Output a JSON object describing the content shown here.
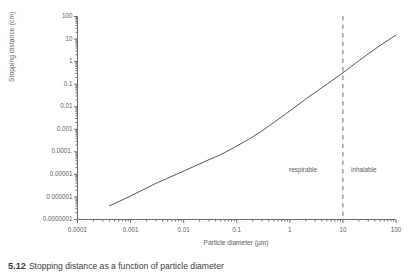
{
  "chart_data": {
    "type": "line",
    "title": "",
    "xlabel": "Particle diameter (µm)",
    "ylabel": "Stopping distance (cm)",
    "xscale": "log",
    "yscale": "log",
    "xlim": [
      0.0001,
      100
    ],
    "ylim": [
      1e-07,
      100
    ],
    "grid": false,
    "legend": "none",
    "x_tick_labels": [
      "0.0001",
      "0.001",
      "0.01",
      "0.1",
      "1",
      "10",
      "100"
    ],
    "x_tick_values": [
      0.0001,
      0.001,
      0.01,
      0.1,
      1,
      10,
      100
    ],
    "y_tick_labels": [
      "100",
      "10",
      "1",
      "0.1",
      "0.01",
      "0.001",
      "0.0001.",
      "0.00001",
      "0.000001",
      "0.0000001"
    ],
    "y_tick_values": [
      100,
      10,
      1,
      0.1,
      0.01,
      0.001,
      0.0001,
      1e-05,
      1e-06,
      1e-07
    ],
    "series": [
      {
        "name": "Stopping distance",
        "x": [
          0.0004,
          0.001,
          0.003,
          0.01,
          0.03,
          0.05,
          0.1,
          0.2,
          0.3,
          0.5,
          1,
          2,
          3,
          5,
          10,
          20,
          30,
          50,
          100
        ],
        "y": [
          4e-07,
          1.1e-06,
          4e-06,
          1.4e-05,
          4.5e-05,
          7.5e-05,
          0.00018,
          0.00046,
          0.00085,
          0.002,
          0.0065,
          0.022,
          0.043,
          0.1,
          0.32,
          1.1,
          2.2,
          5.2,
          15.0
        ]
      }
    ],
    "annotations": [
      {
        "name": "threshold-line",
        "type": "vline",
        "x": 10,
        "style": "dashed",
        "color": "#6e6e70"
      },
      {
        "name": "respirable-label",
        "type": "text",
        "text": "respirable"
      },
      {
        "name": "inhalable-label",
        "type": "text",
        "text": "inhalable"
      }
    ]
  },
  "caption": {
    "number": "5.12",
    "text": "Stopping distance as a function of particle diameter"
  },
  "colors": {
    "curve": "#58585a",
    "axis": "#6b6b6d",
    "text": "#5c5c5e",
    "threshold": "#6e6e70"
  }
}
